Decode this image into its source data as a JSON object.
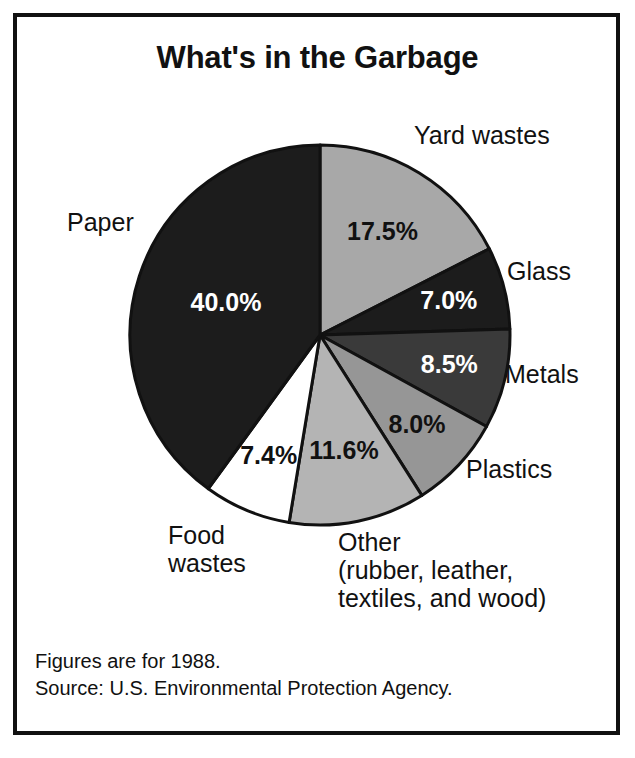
{
  "title": "What's in the Garbage",
  "footnotes": {
    "line1": "Figures are for 1988.",
    "line2": "Source:  U.S. Environmental Protection Agency."
  },
  "labels": {
    "yard": "Yard wastes",
    "glass": "Glass",
    "metals": "Metals",
    "plastics": "Plastics",
    "paper": "Paper",
    "food_line1": "Food",
    "food_line2": "wastes",
    "other_line1": "Other",
    "other_line2": "(rubber, leather,",
    "other_line3": "textiles, and wood)"
  },
  "values": {
    "yard": "17.5%",
    "glass": "7.0%",
    "metals": "8.5%",
    "plastics": "8.0%",
    "other": "11.6%",
    "food": "7.4%",
    "paper": "40.0%"
  },
  "chart_data": {
    "type": "pie",
    "title": "What's in the Garbage",
    "subtitle": "",
    "xlabel": "",
    "ylabel": "",
    "legend_position": "around-slices",
    "grid": false,
    "start_angle_deg": 0,
    "direction": "clockwise",
    "units": "percent of total municipal solid waste",
    "year": 1988,
    "source": "U.S. Environmental Protection Agency",
    "categories": [
      "Yard wastes",
      "Glass",
      "Metals",
      "Plastics",
      "Other (rubber, leather, textiles, and wood)",
      "Food wastes",
      "Paper"
    ],
    "values": [
      17.5,
      7.0,
      8.5,
      8.0,
      11.6,
      7.4,
      40.0
    ],
    "labels": [
      "17.5%",
      "7.0%",
      "8.5%",
      "8.0%",
      "11.6%",
      "7.4%",
      "40.0%"
    ],
    "slice_fills": [
      "#a8a8a8",
      "#1c1c1c",
      "#3a3a3a",
      "#969696",
      "#b4b4b4",
      "#ffffff",
      "#1c1c1c"
    ],
    "slice_text_colors": [
      "#111111",
      "#ffffff",
      "#ffffff",
      "#111111",
      "#111111",
      "#111111",
      "#ffffff"
    ],
    "total": 100.0,
    "annotations": [
      "Figures are for 1988.",
      "Source:  U.S. Environmental Protection Agency."
    ]
  },
  "geometry": {
    "cx": 320,
    "cy": 335,
    "r": 190,
    "value_label_radius_frac": 0.63
  },
  "colors": {
    "ink": "#111111",
    "paper": "#ffffff",
    "outline": "#111111"
  }
}
